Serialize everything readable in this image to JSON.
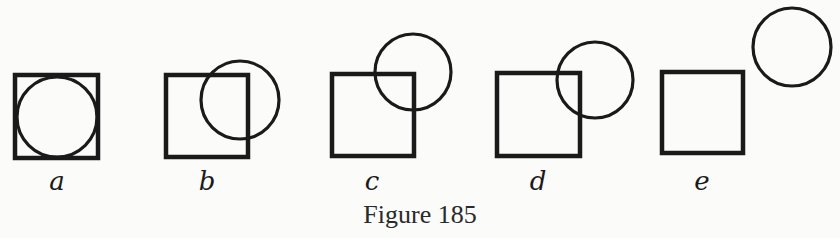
{
  "figure": {
    "caption": "Figure 185",
    "stroke_color": "#1a1a1a",
    "background": "#fbfbf9",
    "panels": [
      {
        "label": "a",
        "description": "circle inscribed in square",
        "square": {
          "x": 15,
          "y": 75,
          "size": 83
        },
        "circle": {
          "cx": 57,
          "cy": 117,
          "r": 40
        },
        "label_x": 57
      },
      {
        "label": "b",
        "description": "circle overlapping upper-right of square",
        "square": {
          "x": 166,
          "y": 75,
          "size": 82
        },
        "circle": {
          "cx": 240,
          "cy": 100,
          "r": 39
        },
        "label_x": 207
      },
      {
        "label": "c",
        "description": "circle centered on upper-right corner of square",
        "square": {
          "x": 332,
          "y": 74,
          "size": 82
        },
        "circle": {
          "cx": 413,
          "cy": 72,
          "r": 38
        },
        "label_x": 372
      },
      {
        "label": "d",
        "description": "circle slightly overlapping upper-right corner of square",
        "square": {
          "x": 497,
          "y": 73,
          "size": 83
        },
        "circle": {
          "cx": 595,
          "cy": 80,
          "r": 38
        },
        "label_x": 538
      },
      {
        "label": "e",
        "description": "circle separated from square",
        "square": {
          "x": 662,
          "y": 72,
          "size": 81
        },
        "circle": {
          "cx": 792,
          "cy": 47,
          "r": 39
        },
        "label_x": 702
      }
    ]
  }
}
